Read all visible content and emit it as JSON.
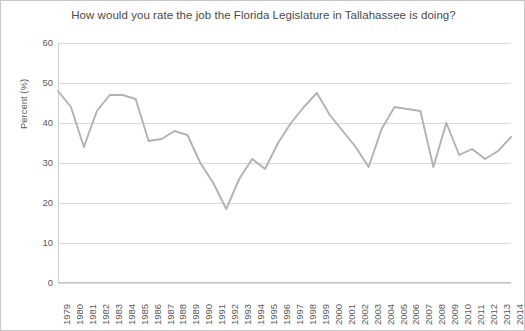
{
  "chart_data": {
    "type": "line",
    "title": "How would you rate the job the Florida Legislature in Tallahassee is doing?",
    "xlabel": "",
    "ylabel": "Percent (%)",
    "ylim": [
      0,
      60
    ],
    "ytick_values": [
      0,
      10,
      20,
      30,
      40,
      50,
      60
    ],
    "ytick_labels": [
      "0",
      "10",
      "20",
      "30",
      "40",
      "50",
      "60"
    ],
    "grid": true,
    "legend": false,
    "line_color": "#b2b2b2",
    "categories": [
      "1979",
      "1980",
      "1981",
      "1982",
      "1983",
      "1984",
      "1985",
      "1986",
      "1987",
      "1988",
      "1989",
      "1990",
      "1991",
      "1992",
      "1993",
      "1994",
      "1995",
      "1996",
      "1997",
      "1998",
      "1999",
      "2000",
      "2001",
      "2002",
      "2003",
      "2004",
      "2005",
      "2006",
      "2007",
      "2008",
      "2009",
      "2010",
      "2011",
      "2012",
      "2013",
      "2014"
    ],
    "values": [
      48,
      44,
      34,
      43,
      47,
      47,
      46,
      35.5,
      36,
      38,
      37,
      30,
      25,
      18.5,
      26,
      31,
      28.5,
      35,
      40,
      44,
      47.5,
      42,
      38,
      34,
      29,
      38.5,
      44,
      43.5,
      43,
      29,
      40,
      32,
      33.5,
      31,
      33,
      36.5
    ],
    "series": [
      {
        "name": "Percent rating job",
        "values": [
          48,
          44,
          34,
          43,
          47,
          47,
          46,
          35.5,
          36,
          38,
          37,
          30,
          25,
          18.5,
          26,
          31,
          28.5,
          35,
          40,
          44,
          47.5,
          42,
          38,
          34,
          29,
          38.5,
          44,
          43.5,
          43,
          29,
          40,
          32,
          33.5,
          31,
          33,
          36.5
        ]
      }
    ]
  }
}
